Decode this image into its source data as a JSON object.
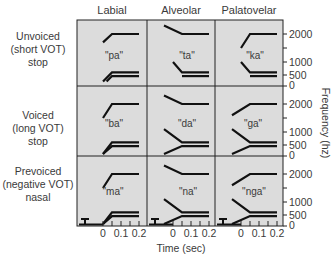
{
  "figure": {
    "columns": [
      "Labial",
      "Alveolar",
      "Palatovelar"
    ],
    "rows": [
      {
        "lines": [
          "Unvoiced",
          "(short VOT)",
          "stop"
        ]
      },
      {
        "lines": [
          "Voiced",
          "(long VOT)",
          "stop"
        ]
      },
      {
        "lines": [
          "Prevoiced",
          "(negative VOT)",
          "nasal"
        ]
      }
    ],
    "syllables": [
      [
        "\"pa\"",
        "\"ta\"",
        "\"ka\""
      ],
      [
        "\"ba\"",
        "\"da\"",
        "\"ga\""
      ],
      [
        "\"ma\"",
        "\"na\"",
        "\"nga\""
      ]
    ],
    "y_axis": {
      "label": "Frequency (hz)",
      "ticks": [
        "2000",
        "1000",
        "500",
        "0"
      ]
    },
    "x_axis": {
      "label": "Time (sec)",
      "ticks": [
        "0",
        "0.1",
        "0.2"
      ]
    },
    "colors": {
      "panel_bg": "#dcdcdc",
      "line": "#111111",
      "grid": "#222222",
      "text": "#3a3a3a"
    }
  },
  "chart_data": {
    "type": "line",
    "title": "",
    "xlabel": "Time (sec)",
    "ylabel": "Frequency (hz)",
    "x_ticks": [
      0,
      0.1,
      0.2
    ],
    "y_ticks": [
      0,
      500,
      1000,
      2000
    ],
    "xlim": [
      -0.1,
      0.2
    ],
    "ylim": [
      0,
      2300
    ],
    "panels": [
      {
        "row": "Unvoiced (short VOT) stop",
        "col": "Labial",
        "syllable": "pa",
        "F3": [
          [
            0,
            1700
          ],
          [
            0.05,
            2000
          ],
          [
            0.2,
            2000
          ]
        ],
        "F2": [
          [
            0,
            200
          ],
          [
            0.05,
            600
          ],
          [
            0.2,
            600
          ]
        ],
        "F1": [
          [
            0.02,
            200
          ],
          [
            0.05,
            450
          ],
          [
            0.2,
            450
          ]
        ]
      },
      {
        "row": "Unvoiced (short VOT) stop",
        "col": "Alveolar",
        "syllable": "ta",
        "F3": [
          [
            -0.05,
            2300
          ],
          [
            0.05,
            2000
          ],
          [
            0.2,
            2000
          ]
        ],
        "F2": [
          [
            0,
            1000
          ],
          [
            0.05,
            600
          ],
          [
            0.2,
            600
          ]
        ],
        "F1": [
          [
            0.05,
            450
          ],
          [
            0.2,
            450
          ]
        ]
      },
      {
        "row": "Unvoiced (short VOT) stop",
        "col": "Palatovelar",
        "syllable": "ka",
        "F3": [
          [
            0,
            1500
          ],
          [
            0.05,
            2000
          ],
          [
            0.2,
            2000
          ]
        ],
        "F2": [
          [
            0,
            1000
          ],
          [
            0.05,
            600
          ],
          [
            0.2,
            600
          ]
        ],
        "F1": [
          [
            0.05,
            450
          ],
          [
            0.2,
            450
          ]
        ]
      },
      {
        "row": "Voiced (long VOT) stop",
        "col": "Labial",
        "syllable": "ba",
        "F3": [
          [
            0,
            1500
          ],
          [
            0.05,
            2000
          ],
          [
            0.2,
            2000
          ]
        ],
        "F2": [
          [
            0,
            0
          ],
          [
            0.05,
            600
          ],
          [
            0.2,
            600
          ]
        ],
        "F1": [
          [
            0,
            0
          ],
          [
            0.05,
            450
          ],
          [
            0.2,
            450
          ]
        ]
      },
      {
        "row": "Voiced (long VOT) stop",
        "col": "Alveolar",
        "syllable": "da",
        "F3": [
          [
            -0.05,
            2300
          ],
          [
            0.05,
            2000
          ],
          [
            0.2,
            2000
          ]
        ],
        "F2": [
          [
            -0.05,
            1100
          ],
          [
            0.05,
            600
          ],
          [
            0.2,
            600
          ]
        ],
        "F1": [
          [
            -0.05,
            0
          ],
          [
            0.05,
            450
          ],
          [
            0.2,
            450
          ]
        ]
      },
      {
        "row": "Voiced (long VOT) stop",
        "col": "Palatovelar",
        "syllable": "ga",
        "F3": [
          [
            -0.05,
            1600
          ],
          [
            0.05,
            2000
          ],
          [
            0.2,
            2000
          ]
        ],
        "F2": [
          [
            -0.05,
            1100
          ],
          [
            0.05,
            600
          ],
          [
            0.2,
            600
          ]
        ],
        "F1": [
          [
            -0.05,
            0
          ],
          [
            0.05,
            450
          ],
          [
            0.2,
            450
          ]
        ]
      },
      {
        "row": "Prevoiced (negative VOT) nasal",
        "col": "Labial",
        "syllable": "ma",
        "F3": [
          [
            0,
            1500
          ],
          [
            0.05,
            2000
          ],
          [
            0.2,
            2000
          ]
        ],
        "F2": [
          [
            0,
            0
          ],
          [
            0.05,
            600
          ],
          [
            0.2,
            600
          ]
        ],
        "F1": [
          [
            0,
            0
          ],
          [
            0.05,
            450
          ],
          [
            0.2,
            450
          ]
        ],
        "prevoicing": [
          [
            -0.1,
            200
          ],
          [
            -0.05,
            200
          ]
        ]
      },
      {
        "row": "Prevoiced (negative VOT) nasal",
        "col": "Alveolar",
        "syllable": "na",
        "F3": [
          [
            -0.05,
            2300
          ],
          [
            0.05,
            2000
          ],
          [
            0.2,
            2000
          ]
        ],
        "F2": [
          [
            -0.05,
            1100
          ],
          [
            0.05,
            600
          ],
          [
            0.2,
            600
          ]
        ],
        "F1": [
          [
            -0.05,
            0
          ],
          [
            0.05,
            450
          ],
          [
            0.2,
            450
          ]
        ],
        "prevoicing": [
          [
            -0.1,
            200
          ],
          [
            -0.05,
            200
          ]
        ]
      },
      {
        "row": "Prevoiced (negative VOT) nasal",
        "col": "Palatovelar",
        "syllable": "nga",
        "F3": [
          [
            -0.05,
            1600
          ],
          [
            0.05,
            2000
          ],
          [
            0.2,
            2000
          ]
        ],
        "F2": [
          [
            -0.05,
            1100
          ],
          [
            0.05,
            600
          ],
          [
            0.2,
            600
          ]
        ],
        "F1": [
          [
            -0.05,
            0
          ],
          [
            0.05,
            450
          ],
          [
            0.2,
            450
          ]
        ],
        "prevoicing": [
          [
            -0.1,
            200
          ],
          [
            -0.05,
            200
          ]
        ]
      }
    ]
  }
}
